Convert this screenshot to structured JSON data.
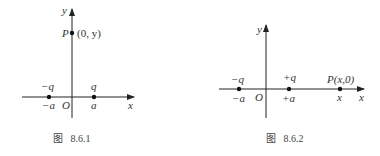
{
  "figures": [
    {
      "caption": "图   8.6.1",
      "axes": {
        "x_label": "x",
        "y_label": "y",
        "origin_label": "O"
      },
      "point_P": {
        "name": "P",
        "coord": "(0, y)"
      },
      "charges": [
        {
          "charge_label": "−q",
          "position_label": "−a"
        },
        {
          "charge_label": "q",
          "position_label": "a"
        }
      ]
    },
    {
      "caption": "图   8.6.2",
      "axes": {
        "x_label": "x",
        "y_label": "y",
        "origin_label": "O"
      },
      "point_P": {
        "label": "P(x,0)",
        "position_label": "x"
      },
      "charges": [
        {
          "charge_label": "−q",
          "position_label": "−a"
        },
        {
          "charge_label": "+q",
          "position_label": "+a"
        }
      ]
    }
  ]
}
